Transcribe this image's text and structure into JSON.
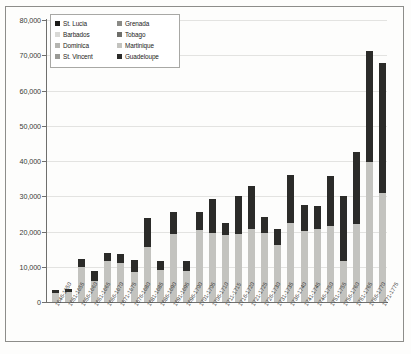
{
  "frame": {
    "border_color": "#8d8d8a"
  },
  "legend": {
    "position": "top-left-inside-plot",
    "columns": [
      {
        "items": [
          {
            "label": "St. Lucia",
            "color": "#1c1c1a"
          },
          {
            "label": "Barbados",
            "color": "#d9d9d6"
          },
          {
            "label": "Dominica",
            "color": "#b5b5b1"
          },
          {
            "label": "St. Vincent",
            "color": "#9a9a96"
          }
        ]
      },
      {
        "items": [
          {
            "label": "Grenada",
            "color": "#8a8a86"
          },
          {
            "label": "Tobago",
            "color": "#6e6e6a"
          },
          {
            "label": "Martinique",
            "color": "#c3c3bf"
          },
          {
            "label": "Guadeloupe",
            "color": "#2b2b29"
          }
        ]
      }
    ]
  },
  "axis": {
    "y_ticks": [
      "80,000",
      "70,000",
      "60,000",
      "50,000",
      "40,000",
      "30,000",
      "20,000",
      "10,000",
      "0"
    ],
    "y_tick_values": [
      80000,
      70000,
      60000,
      50000,
      40000,
      30000,
      20000,
      10000,
      0
    ]
  },
  "chart_data": {
    "type": "bar",
    "title": "",
    "subtitle": "",
    "xlabel": "",
    "ylabel": "",
    "ylim": [
      0,
      80000
    ],
    "grid": true,
    "stacked": true,
    "legend_position": "top-left",
    "categories": [
      "1646-1650",
      "1651-1655",
      "1656-1660",
      "1661-1665",
      "1666-1670",
      "1671-1675",
      "1676-1680",
      "1681-1685",
      "1686-1690",
      "1691-1695",
      "1696-1700",
      "1701-1705",
      "1706-1710",
      "1711-1715",
      "1716-1720",
      "1721-1725",
      "1726-1730",
      "1731-1735",
      "1736-1740",
      "1741-1745",
      "1746-1750",
      "1751-1755",
      "1756-1760",
      "1761-1765",
      "1766-1770",
      "1771-1775"
    ],
    "series": [
      {
        "name": "Martinique",
        "color": "#c3c3bf",
        "values": [
          2600,
          2700,
          9800,
          5900,
          11600,
          11200,
          8500,
          15600,
          9100,
          19300,
          8800,
          20300,
          19700,
          18900,
          19200,
          20600,
          19500,
          16300,
          22500,
          20200,
          20800,
          21600,
          11700,
          22100,
          39800,
          30800
        ]
      },
      {
        "name": "Guadeloupe",
        "color": "#2b2b29",
        "values": [
          900,
          900,
          2500,
          3000,
          2200,
          2300,
          3400,
          8200,
          2500,
          6300,
          2900,
          5300,
          9600,
          3500,
          11000,
          12200,
          4600,
          4500,
          13400,
          7200,
          6400,
          14200,
          18500,
          20500,
          31500,
          37100
        ]
      }
    ],
    "totals": [
      3500,
      3600,
      12300,
      8900,
      13800,
      13500,
      11900,
      23800,
      11600,
      25600,
      11700,
      25600,
      29300,
      22400,
      30200,
      32800,
      24100,
      20800,
      35900,
      27400,
      27200,
      35800,
      30200,
      42600,
      71300,
      67900
    ]
  }
}
